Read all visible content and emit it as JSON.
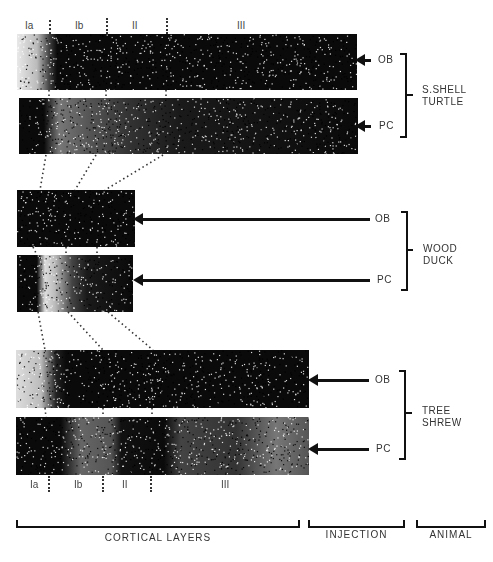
{
  "figure": {
    "layer_labels_top": [
      "Ia",
      "Ib",
      "II",
      "III"
    ],
    "layer_labels_bottom": [
      "Ia",
      "Ib",
      "II",
      "III"
    ],
    "animals": [
      {
        "name_line1": "S.SHELL",
        "name_line2": "TURTLE",
        "rows": [
          {
            "injection": "OB"
          },
          {
            "injection": "PC"
          }
        ]
      },
      {
        "name_line1": "WOOD",
        "name_line2": "DUCK",
        "rows": [
          {
            "injection": "OB"
          },
          {
            "injection": "PC"
          }
        ]
      },
      {
        "name_line1": "TREE",
        "name_line2": "SHREW",
        "rows": [
          {
            "injection": "OB"
          },
          {
            "injection": "PC"
          }
        ]
      }
    ],
    "group_labels": {
      "cortical_layers": "CORTICAL LAYERS",
      "injection": "INJECTION",
      "animal": "ANIMAL"
    }
  }
}
